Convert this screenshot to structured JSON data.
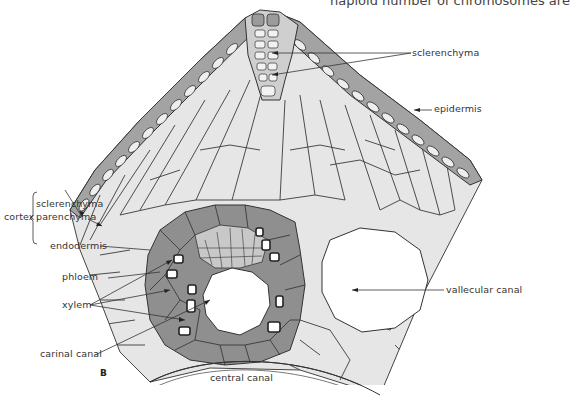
{
  "page": {
    "running_text_fragment": "haploid number of chromosomes are",
    "figure_letter": "B"
  },
  "diagram": {
    "labels": {
      "sclerenchyma_top": "sclerenchyma",
      "epidermis": "epidermis",
      "cortex": "cortex",
      "cortex_sclerenchyma": "sclerenchyma",
      "cortex_parenchyma": "parenchyma",
      "endodermis": "endodermis",
      "phloem": "phloem",
      "xylem": "xylem",
      "carinal_canal": "carinal canal",
      "vallecular_canal": "vallecular canal",
      "central_canal": "central canal"
    },
    "colors": {
      "background": "#ffffff",
      "parenchyma_fill": "#e6e6e6",
      "bundle_dark_fill": "#8f8f8f",
      "phloem_fill": "#c8c8c8",
      "epidermis_fill": "#9a9a9a",
      "cell_wall": "#333333",
      "canal_fill": "#ffffff"
    }
  }
}
